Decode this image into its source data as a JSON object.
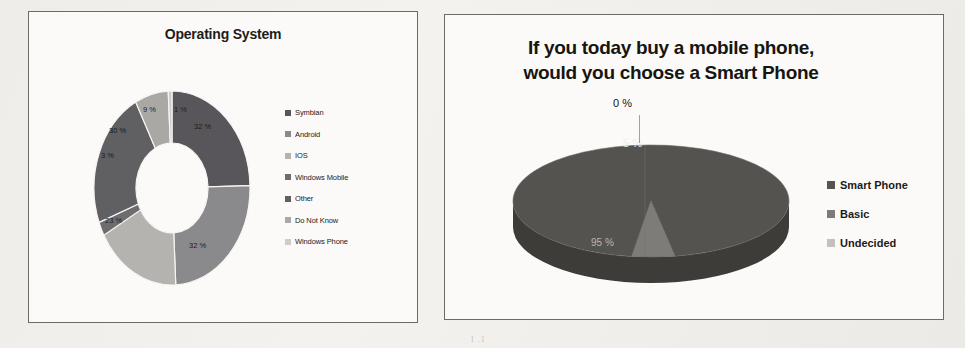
{
  "background": {
    "page_color": "#f2f0ec",
    "ghost_marks": [
      "9.01",
      "I) TW",
      "t 2 dmm",
      "3.1 2",
      "1 .1"
    ]
  },
  "panels": {
    "left": {
      "name": "operating-system-chart-panel",
      "border_color": "#6e6a64",
      "fill_color": "#fbfaf8"
    },
    "right": {
      "name": "smart-phone-chart-panel",
      "border_color": "#6e6a64",
      "fill_color": "#fbfaf8"
    }
  },
  "chart_data": [
    {
      "type": "pie",
      "variant": "doughnut",
      "title": "Operating System",
      "xlabel": "",
      "ylabel": "",
      "legend_position": "right",
      "labels": [
        "Symbian",
        "Android",
        "IOS",
        "Windows Mobile",
        "Other",
        "Do Not Know",
        "Windows Phone"
      ],
      "values": [
        32,
        32,
        23,
        3,
        30,
        9,
        1
      ],
      "value_labels": [
        "32 %",
        "32 %",
        "23 %",
        "3 %",
        "30 %",
        "9 %",
        "1 %"
      ],
      "colors": [
        "#58565a",
        "#8a8a8c",
        "#b4b3b0",
        "#6d6c6e",
        "#605f62",
        "#a9a8a5",
        "#cfcdc9"
      ],
      "slices": [
        {
          "label": "Symbian",
          "value": 32,
          "value_label": "32 %",
          "color": "#58565a"
        },
        {
          "label": "Android",
          "value": 32,
          "value_label": "32 %",
          "color": "#8a8a8c"
        },
        {
          "label": "IOS",
          "value": 23,
          "value_label": "23 %",
          "color": "#b4b3b0"
        },
        {
          "label": "Windows Mobile",
          "value": 3,
          "value_label": "3 %",
          "color": "#6d6c6e"
        },
        {
          "label": "Other",
          "value": 30,
          "value_label": "30 %",
          "color": "#605f62"
        },
        {
          "label": "Do Not Know",
          "value": 9,
          "value_label": "9 %",
          "color": "#a9a8a5"
        },
        {
          "label": "Windows Phone",
          "value": 1,
          "value_label": "1 %",
          "color": "#cfcdc9"
        }
      ]
    },
    {
      "type": "pie",
      "variant": "pie-3d",
      "title": "If you today buy a mobile phone, would you choose a Smart Phone",
      "title_line1": "If you today buy a mobile phone,",
      "title_line2": "would you choose a Smart Phone",
      "xlabel": "",
      "ylabel": "",
      "legend_position": "right",
      "labels": [
        "Smart Phone",
        "Basic",
        "Undecided"
      ],
      "values": [
        95,
        5,
        0
      ],
      "value_labels": [
        "95 %",
        "5 %",
        "0 %"
      ],
      "colors": [
        "#55534f",
        "#7e7c79",
        "#c3c1bd"
      ],
      "slices": [
        {
          "label": "Smart Phone",
          "value": 95,
          "value_label": "95 %",
          "color": "#55534f"
        },
        {
          "label": "Basic",
          "value": 5,
          "value_label": "5 %",
          "color": "#7e7c79"
        },
        {
          "label": "Undecided",
          "value": 0,
          "value_label": "0 %",
          "color": "#c3c1bd"
        }
      ]
    }
  ]
}
